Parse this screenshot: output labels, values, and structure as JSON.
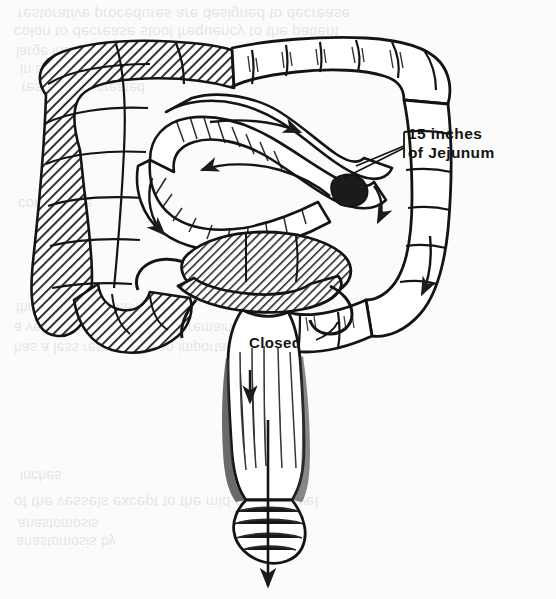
{
  "page": {
    "width": 556,
    "height": 599,
    "background_color": "#fbfbfa",
    "ink_color": "#141414"
  },
  "annotations": {
    "jejunum": {
      "line1": "15 inches",
      "line2": "of Jejunum",
      "leader": "leader-line-to-anastomosis"
    },
    "closed": {
      "label": "Closed"
    }
  },
  "bleed_through": {
    "note": "Faint mirrored show-through text from the reverse side of the printed page",
    "lines": [
      {
        "text": "restorative procedures are designed to decrease",
        "x": 18,
        "y": 6,
        "size": 15,
        "font": "sans"
      },
      {
        "text": "colon to decrease stool frequency to the patient",
        "x": 14,
        "y": 24,
        "size": 15,
        "font": "sans"
      },
      {
        "text": "large intestine and its reservoir function",
        "x": 16,
        "y": 44,
        "size": 14,
        "font": "sans"
      },
      {
        "text": "in shape and capacity to the rectum",
        "x": 20,
        "y": 62,
        "size": 14,
        "font": "sans"
      },
      {
        "text": "reservoir is created",
        "x": 22,
        "y": 80,
        "size": 14,
        "font": "sans"
      },
      {
        "text": "continence",
        "x": 18,
        "y": 196,
        "size": 15,
        "font": "sans"
      },
      {
        "text": "this procedure the ileum is",
        "x": 16,
        "y": 300,
        "size": 14,
        "font": "sans"
      },
      {
        "text": "a very long segment of the remaining colon",
        "x": 14,
        "y": 320,
        "size": 14,
        "font": "sans"
      },
      {
        "text": "has a less reservoir is an important principle",
        "x": 14,
        "y": 340,
        "size": 14,
        "font": "sans"
      },
      {
        "text": "inches",
        "x": 20,
        "y": 468,
        "size": 14,
        "font": "sans"
      },
      {
        "text": "of the vessels except to the mid of the bowel",
        "x": 14,
        "y": 494,
        "size": 15,
        "font": "sans"
      },
      {
        "text": "anastomosis",
        "x": 18,
        "y": 516,
        "size": 14,
        "font": "sans"
      },
      {
        "text": "anastomosis by",
        "x": 16,
        "y": 534,
        "size": 14,
        "font": "sans"
      }
    ]
  },
  "figure": {
    "type": "medical-line-drawing",
    "parts": [
      {
        "name": "ascending-colon-hatched",
        "shading": "diagonal-hatch"
      },
      {
        "name": "transverse-colon",
        "shading": "outline-haustra"
      },
      {
        "name": "descending-colon",
        "shading": "outline-haustra"
      },
      {
        "name": "jejunal-interposition-loop",
        "shading": "outline"
      },
      {
        "name": "excluded-bowel-segment-hatched",
        "shading": "diagonal-hatch"
      },
      {
        "name": "rectum",
        "shading": "outline"
      },
      {
        "name": "anal-canal",
        "shading": "outline"
      },
      {
        "name": "flow-arrows",
        "count": 6
      }
    ]
  }
}
